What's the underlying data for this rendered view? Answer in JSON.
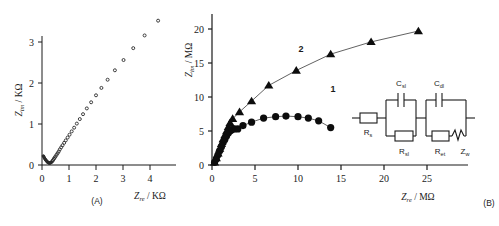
{
  "figure": {
    "panels": [
      {
        "id": "A",
        "caption": "(A)",
        "xlabel_sym": "Z",
        "xlabel_sub": "re",
        "xlabel_unit": " / KΩ",
        "ylabel_sym": "Z",
        "ylabel_sub": "im",
        "ylabel_unit": " / KΩ"
      },
      {
        "id": "B",
        "caption": "(B)",
        "xlabel_sym": "Z",
        "xlabel_sub": "re",
        "xlabel_unit": " / MΩ",
        "ylabel_sym": "Z",
        "ylabel_sub": "im",
        "ylabel_unit": " / MΩ"
      }
    ],
    "inset": {
      "elements": [
        {
          "name": "Rs",
          "sym": "R",
          "sub": "s"
        },
        {
          "name": "Csl",
          "sym": "C",
          "sub": "sl"
        },
        {
          "name": "Rsl",
          "sym": "R",
          "sub": "sl"
        },
        {
          "name": "Cdl",
          "sym": "C",
          "sub": "dl"
        },
        {
          "name": "Ret",
          "sym": "R",
          "sub": "et"
        },
        {
          "name": "Zw",
          "sym": "Z",
          "sub": "w"
        }
      ]
    }
  },
  "chart_data": [
    {
      "type": "scatter",
      "panel": "A",
      "title": "",
      "xlabel": "Z_re / KΩ",
      "ylabel": "Z_im / KΩ",
      "xlim": [
        -0.25,
        4.8
      ],
      "ylim": [
        -0.2,
        3.75
      ],
      "xticks": [
        0,
        1,
        2,
        3,
        4
      ],
      "yticks": [
        0,
        1,
        2,
        3
      ],
      "grid": false,
      "legend": "none",
      "marker": "small-dot",
      "series": [
        {
          "name": "impedance spectrum",
          "points": [
            [
              0.05,
              0.22
            ],
            [
              0.07,
              0.2
            ],
            [
              0.09,
              0.17
            ],
            [
              0.11,
              0.15
            ],
            [
              0.13,
              0.13
            ],
            [
              0.15,
              0.11
            ],
            [
              0.17,
              0.1
            ],
            [
              0.19,
              0.08
            ],
            [
              0.21,
              0.07
            ],
            [
              0.23,
              0.06
            ],
            [
              0.25,
              0.05
            ],
            [
              0.27,
              0.05
            ],
            [
              0.29,
              0.05
            ],
            [
              0.31,
              0.05
            ],
            [
              0.33,
              0.06
            ],
            [
              0.35,
              0.07
            ],
            [
              0.38,
              0.09
            ],
            [
              0.41,
              0.12
            ],
            [
              0.44,
              0.15
            ],
            [
              0.47,
              0.18
            ],
            [
              0.5,
              0.21
            ],
            [
              0.54,
              0.25
            ],
            [
              0.58,
              0.29
            ],
            [
              0.62,
              0.33
            ],
            [
              0.66,
              0.38
            ],
            [
              0.71,
              0.43
            ],
            [
              0.76,
              0.48
            ],
            [
              0.82,
              0.54
            ],
            [
              0.88,
              0.6
            ],
            [
              0.95,
              0.67
            ],
            [
              1.02,
              0.74
            ],
            [
              1.1,
              0.82
            ],
            [
              1.19,
              0.91
            ],
            [
              1.29,
              1.01
            ],
            [
              1.4,
              1.12
            ],
            [
              1.52,
              1.24
            ],
            [
              1.66,
              1.38
            ],
            [
              1.82,
              1.53
            ],
            [
              2.0,
              1.7
            ],
            [
              2.2,
              1.88
            ],
            [
              2.43,
              2.08
            ],
            [
              2.7,
              2.31
            ],
            [
              3.02,
              2.56
            ],
            [
              3.38,
              2.85
            ],
            [
              3.8,
              3.16
            ],
            [
              4.3,
              3.52
            ]
          ]
        }
      ]
    },
    {
      "type": "scatter",
      "panel": "B",
      "title": "",
      "xlabel": "Z_re / MΩ",
      "ylabel": "Z_im / MΩ",
      "xlim": [
        -1.2,
        27.5
      ],
      "ylim": [
        -1.0,
        21.8
      ],
      "xticks": [
        0,
        5,
        10,
        15,
        20,
        25
      ],
      "yticks": [
        0,
        5,
        10,
        15,
        20
      ],
      "grid": false,
      "legend": "inline-labels",
      "series": [
        {
          "name": "1",
          "label": "1",
          "marker": "filled-circle",
          "line": true,
          "points": [
            [
              0.3,
              0.4
            ],
            [
              0.5,
              0.9
            ],
            [
              0.7,
              1.5
            ],
            [
              0.9,
              2.1
            ],
            [
              1.1,
              2.7
            ],
            [
              1.3,
              3.3
            ],
            [
              1.5,
              3.8
            ],
            [
              1.7,
              4.3
            ],
            [
              1.9,
              4.7
            ],
            [
              2.1,
              5.0
            ],
            [
              2.3,
              5.2
            ],
            [
              2.6,
              5.3
            ],
            [
              3.0,
              5.3
            ],
            [
              3.6,
              5.8
            ],
            [
              4.6,
              6.3
            ],
            [
              6.0,
              6.9
            ],
            [
              7.4,
              7.1
            ],
            [
              8.6,
              7.2
            ],
            [
              10.0,
              7.1
            ],
            [
              11.2,
              6.9
            ],
            [
              12.4,
              6.5
            ],
            [
              13.8,
              5.5
            ]
          ]
        },
        {
          "name": "2",
          "label": "2",
          "marker": "filled-triangle",
          "line": true,
          "points": [
            [
              0.3,
              0.4
            ],
            [
              0.5,
              1.0
            ],
            [
              0.7,
              1.7
            ],
            [
              0.9,
              2.4
            ],
            [
              1.1,
              3.1
            ],
            [
              1.3,
              3.8
            ],
            [
              1.5,
              4.4
            ],
            [
              1.7,
              5.0
            ],
            [
              1.9,
              5.6
            ],
            [
              2.1,
              6.2
            ],
            [
              2.4,
              6.8
            ],
            [
              3.2,
              7.8
            ],
            [
              4.6,
              9.4
            ],
            [
              6.6,
              11.7
            ],
            [
              9.8,
              13.9
            ],
            [
              13.8,
              16.3
            ],
            [
              18.5,
              18.1
            ],
            [
              24.0,
              19.7
            ]
          ]
        }
      ]
    }
  ]
}
